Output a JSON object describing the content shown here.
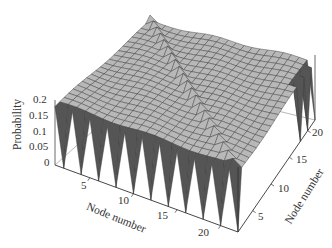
{
  "chart_data": {
    "type": "surface3d",
    "title": "",
    "xlabel": "Node number",
    "ylabel": "Node number",
    "zlabel": "Probability",
    "x_ticks": [
      5,
      10,
      15,
      20
    ],
    "y_ticks": [
      5,
      10,
      15,
      20
    ],
    "z_ticks": [
      "0",
      "0.05",
      "0.1",
      "0.15",
      "0.2"
    ],
    "x_range": [
      1,
      22
    ],
    "y_range": [
      1,
      22
    ],
    "zlim": [
      0,
      0.2
    ],
    "grid_size": 22,
    "plateau_value": 0.18,
    "diagonal_value": 0.2,
    "edge_dip_value": 0.0,
    "surface_color": "#b8b8b8",
    "shadow_color": "#555555"
  },
  "axes": {
    "z_label": "Probability",
    "x_label": "Node number",
    "y_label": "Node number",
    "z_ticks": [
      "0.2",
      "0.15",
      "0.1",
      "0.05",
      "0"
    ],
    "x_ticks": [
      "5",
      "10",
      "15",
      "20"
    ],
    "y_ticks": [
      "5",
      "10",
      "15",
      "20"
    ]
  }
}
